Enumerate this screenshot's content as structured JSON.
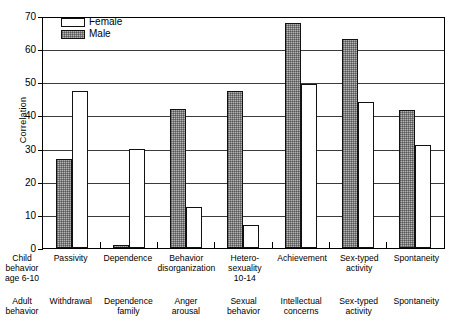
{
  "chart_data": {
    "type": "bar",
    "title": "",
    "xlabel": "",
    "ylabel": "Correlation",
    "ylim": [
      0,
      70
    ],
    "yticks": [
      0,
      10,
      20,
      30,
      40,
      50,
      60,
      70
    ],
    "grid": true,
    "legend_position": "top-left",
    "categories": [
      "Passivity",
      "Dependence",
      "Behavior disorganization",
      "Hetero-sexuality 10-14",
      "Achievement",
      "Sex-typed activity",
      "Spontaneity"
    ],
    "series": [
      {
        "name": "Male",
        "color": "#b4b4b4",
        "values": [
          27,
          1,
          42,
          47.5,
          68,
          63,
          41.5
        ]
      },
      {
        "name": "Female",
        "color": "#ffffff",
        "values": [
          47.5,
          30,
          12.5,
          7,
          49.5,
          44,
          31
        ]
      }
    ],
    "bar_order_in_group": [
      "Male",
      "Female"
    ]
  },
  "legend": {
    "items": [
      {
        "label": "Female",
        "swatch": "white-outline"
      },
      {
        "label": "Male",
        "swatch": "shaded"
      }
    ]
  },
  "axes": {
    "y_label": "Correlation",
    "y_ticks": [
      "70",
      "60",
      "50",
      "40",
      "30",
      "20",
      "10",
      "0"
    ]
  },
  "x_axis": {
    "child_row_title": [
      "Child",
      "behavior",
      "age 6-10"
    ],
    "adult_row_title": [
      "Adult",
      "behavior"
    ],
    "child_labels": [
      [
        "Passivity"
      ],
      [
        "Dependence"
      ],
      [
        "Behavior",
        "disorganization"
      ],
      [
        "Hetero-",
        "sexuality",
        "10-14"
      ],
      [
        "Achievement"
      ],
      [
        "Sex-typed",
        "activity"
      ],
      [
        "Spontaneity"
      ]
    ],
    "adult_labels": [
      [
        "Withdrawal"
      ],
      [
        "Dependence",
        "family"
      ],
      [
        "Anger",
        "arousal"
      ],
      [
        "Sexual",
        "behavior"
      ],
      [
        "Intellectual",
        "concerns"
      ],
      [
        "Sex-typed",
        "activity"
      ],
      [
        "Spontaneity"
      ]
    ]
  }
}
